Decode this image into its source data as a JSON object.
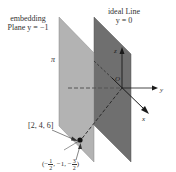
{
  "labels": {
    "embedding_plane_line1": "embedding",
    "embedding_plane_line2": "Plane y = −1",
    "ideal_line_line1": "ideal Line",
    "ideal_line_line2": "y = 0",
    "pi": "π",
    "origin": "O",
    "axis_z": "z",
    "axis_y": "y",
    "axis_x": "x",
    "homogeneous_point": "[2, 4, 6]",
    "embedded_point_open": "(−",
    "embedded_point_frac1_num": "1",
    "embedded_point_frac1_den": "2",
    "embedded_point_mid": ", −1, −",
    "embedded_point_frac2_num": "3",
    "embedded_point_frac2_den": "2",
    "embedded_point_close": ")"
  },
  "colors": {
    "front_plane": "#b3b3b3",
    "back_plane": "#6f6f6f",
    "axis": "#1a1a1a",
    "dashed": "#333333",
    "point": "#111111"
  }
}
